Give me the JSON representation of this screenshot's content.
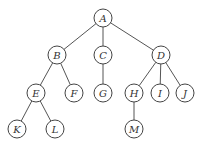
{
  "diagram": {
    "type": "tree",
    "node_radius": 9,
    "colors": {
      "stroke": "#444444",
      "edge": "#555555",
      "text": "#333333",
      "background": "#ffffff"
    },
    "nodes": [
      {
        "id": "A",
        "label": "A",
        "x": 103,
        "y": 18
      },
      {
        "id": "B",
        "label": "B",
        "x": 57,
        "y": 55
      },
      {
        "id": "C",
        "label": "C",
        "x": 103,
        "y": 55
      },
      {
        "id": "D",
        "label": "D",
        "x": 161,
        "y": 55
      },
      {
        "id": "E",
        "label": "E",
        "x": 36,
        "y": 93
      },
      {
        "id": "F",
        "label": "F",
        "x": 74,
        "y": 93
      },
      {
        "id": "G",
        "label": "G",
        "x": 103,
        "y": 93
      },
      {
        "id": "H",
        "label": "H",
        "x": 134,
        "y": 93
      },
      {
        "id": "I",
        "label": "I",
        "x": 160,
        "y": 93
      },
      {
        "id": "J",
        "label": "J",
        "x": 185,
        "y": 93
      },
      {
        "id": "K",
        "label": "K",
        "x": 17,
        "y": 129
      },
      {
        "id": "L",
        "label": "L",
        "x": 55,
        "y": 129
      },
      {
        "id": "M",
        "label": "M",
        "x": 134,
        "y": 129
      }
    ],
    "edges": [
      [
        "A",
        "B"
      ],
      [
        "A",
        "C"
      ],
      [
        "A",
        "D"
      ],
      [
        "B",
        "E"
      ],
      [
        "B",
        "F"
      ],
      [
        "C",
        "G"
      ],
      [
        "D",
        "H"
      ],
      [
        "D",
        "I"
      ],
      [
        "D",
        "J"
      ],
      [
        "E",
        "K"
      ],
      [
        "E",
        "L"
      ],
      [
        "H",
        "M"
      ]
    ]
  }
}
